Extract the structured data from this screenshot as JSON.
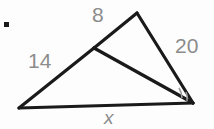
{
  "figure": {
    "type": "geometry-diagram",
    "canvas": {
      "width": 214,
      "height": 129,
      "background": "#fdfdfd"
    },
    "stroke_color": "#1a1a1a",
    "label_color": "#8c8c8c",
    "marker_color": "#9a9a9a",
    "vertices": {
      "apex": {
        "name": "A",
        "x": 137,
        "y": 13
      },
      "left": {
        "name": "B",
        "x": 19,
        "y": 108
      },
      "right": {
        "name": "C",
        "x": 193,
        "y": 103
      },
      "cevian_point": {
        "name": "D",
        "x": 94,
        "y": 48
      }
    },
    "segments": [
      {
        "name": "apex-to-cevian-point",
        "from": "A",
        "to": "D",
        "label": "8"
      },
      {
        "name": "cevian-point-to-left",
        "from": "D",
        "to": "B",
        "label": "14"
      },
      {
        "name": "apex-to-right",
        "from": "A",
        "to": "C",
        "label": "20"
      },
      {
        "name": "left-to-right-base",
        "from": "B",
        "to": "C",
        "label": "x"
      },
      {
        "name": "cevian",
        "from": "D",
        "to": "C",
        "label": ""
      }
    ],
    "labels": {
      "side_8": "8",
      "side_14": "14",
      "side_20": "20",
      "side_x": "x"
    },
    "angle_markers": {
      "at_vertex": "C",
      "count": 2,
      "description": "two small arc marks at the right vertex"
    },
    "bullet": {
      "name": "list-bullet",
      "x": 5,
      "y": 23,
      "size": 5,
      "color": "#1a1a1a"
    }
  }
}
